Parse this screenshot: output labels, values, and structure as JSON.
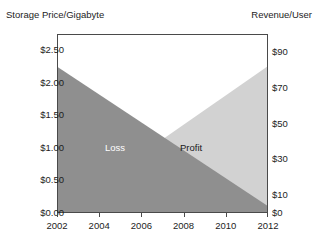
{
  "chart_data": {
    "type": "area",
    "title": "",
    "subtitle": "",
    "xlabel": "",
    "ylabel": "Storage Price/Gigabyte",
    "y2label": "Revenue/User",
    "grid": false,
    "legend_position": "inline-annotations",
    "x": [
      2002,
      2004,
      2006,
      2008,
      2010,
      2012
    ],
    "x_tick_labels": [
      "2002",
      "2004",
      "2006",
      "2008",
      "2010",
      "2012"
    ],
    "xlim": [
      2002,
      2012
    ],
    "ylim": [
      0.0,
      2.75
    ],
    "y_tick_labels": [
      "$2.50",
      "$2.00",
      "$1.50",
      "$1.00",
      "$0.50",
      "$0.00"
    ],
    "y_tick_values": [
      2.5,
      2.0,
      1.5,
      1.0,
      0.5,
      0.0
    ],
    "y2lim": [
      0,
      100
    ],
    "y2_tick_labels": [
      "$90",
      "$70",
      "$50",
      "$30",
      "$10",
      "$0"
    ],
    "y2_tick_values": [
      90,
      70,
      50,
      30,
      10,
      0
    ],
    "series": [
      {
        "name": "Storage Price/Gigabyte",
        "axis": "left",
        "color": "#8f8f8f",
        "annotation": "Loss",
        "x": [
          2002,
          2012
        ],
        "values": [
          2.25,
          0.1
        ]
      },
      {
        "name": "Revenue/User",
        "axis": "right",
        "color": "#d2d2d2",
        "annotation": "Profit",
        "x": [
          2002,
          2012
        ],
        "values": [
          0,
          82
        ]
      }
    ],
    "annotations": [
      {
        "text": "Loss",
        "x": 2004.3,
        "y": 1.35,
        "color": "#ffffff"
      },
      {
        "text": "Profit",
        "x": 2008.0,
        "y": 1.35,
        "color": "#1a1a1a"
      }
    ],
    "crossover": {
      "x": 2006.7,
      "y_left": 1.28,
      "y_right": 41
    }
  },
  "colors": {
    "loss_fill": "#8f8f8f",
    "profit_fill": "#d2d2d2",
    "frame": "#4a4a4a",
    "background": "#ffffff",
    "text": "#1d1d1d",
    "loss_label_text": "#ffffff",
    "profit_label_text": "#1a1a1a"
  },
  "axes": {
    "left_title": "Storage Price/Gigabyte",
    "right_title": "Revenue/User"
  }
}
